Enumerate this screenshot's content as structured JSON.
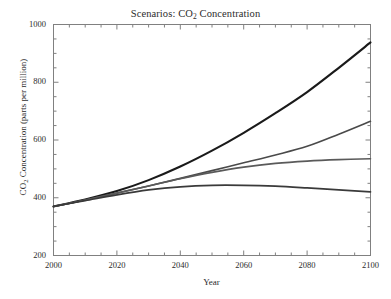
{
  "chart_data": {
    "type": "line",
    "title": "Scenarios: CO2 Concentration",
    "title_main": "Scenarios: CO",
    "title_sub": "2",
    "title_tail": " Concentration",
    "xlabel": "Year",
    "ylabel": "CO2 Concentration (parts per million)",
    "ylabel_main": "CO",
    "ylabel_sub": "2",
    "ylabel_tail": " Concentration (parts per million)",
    "xlim": [
      2000,
      2100
    ],
    "ylim": [
      200,
      1000
    ],
    "xticks": [
      2000,
      2020,
      2040,
      2060,
      2080,
      2100
    ],
    "yticks": [
      200,
      400,
      600,
      800,
      1000
    ],
    "xtick_labels": [
      "2000",
      "2020",
      "2040",
      "2060",
      "2080",
      "2100"
    ],
    "ytick_labels": [
      "200",
      "400",
      "600",
      "800",
      "1000"
    ],
    "x_minor_interval": 5,
    "y_minor_interval": 50,
    "grid": false,
    "legend": "none",
    "x": [
      2000,
      2010,
      2020,
      2030,
      2040,
      2050,
      2060,
      2070,
      2080,
      2090,
      2100
    ],
    "series": [
      {
        "name": "high-scenario",
        "color": "#1a1a1a",
        "width": 2.1,
        "values": [
          370,
          394,
          423,
          461,
          508,
          563,
          625,
          693,
          766,
          850,
          938
        ]
      },
      {
        "name": "medium-high-scenario",
        "color": "#4a4a4a",
        "width": 1.6,
        "values": [
          370,
          392,
          416,
          441,
          467,
          494,
          521,
          548,
          578,
          620,
          665
        ]
      },
      {
        "name": "medium-low-scenario",
        "color": "#5a5a5a",
        "width": 1.6,
        "values": [
          370,
          392,
          416,
          441,
          466,
          488,
          506,
          519,
          527,
          532,
          535
        ]
      },
      {
        "name": "low-scenario",
        "color": "#3a3a3a",
        "width": 1.7,
        "values": [
          370,
          390,
          410,
          427,
          438,
          443,
          443,
          440,
          434,
          427,
          420
        ]
      }
    ]
  },
  "figure": {
    "background_color": "#ffffff",
    "axis_color": "#808080",
    "text_color": "#2b2b2b"
  }
}
